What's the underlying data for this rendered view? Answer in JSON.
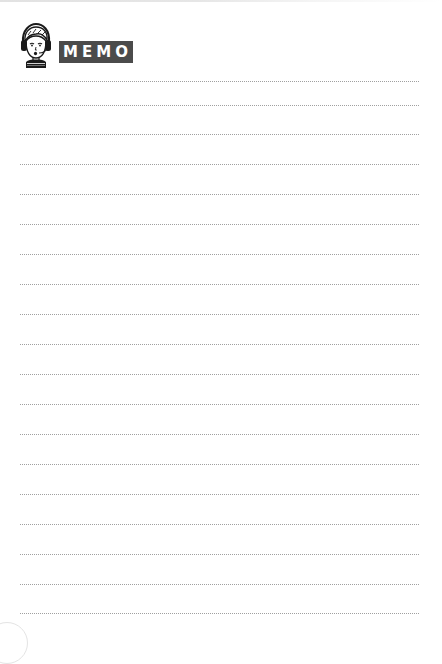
{
  "header": {
    "title": "MEMO",
    "avatar_icon": "boy-with-headphones-icon",
    "badge_color": "#4b4b4b"
  },
  "lines": {
    "count": 19,
    "style": "dotted",
    "color": "#8f8f8f",
    "positions_y": [
      81,
      105,
      134,
      164,
      194,
      224,
      254,
      284,
      314,
      344,
      374,
      404,
      434,
      464,
      494,
      524,
      554,
      584,
      613
    ]
  }
}
